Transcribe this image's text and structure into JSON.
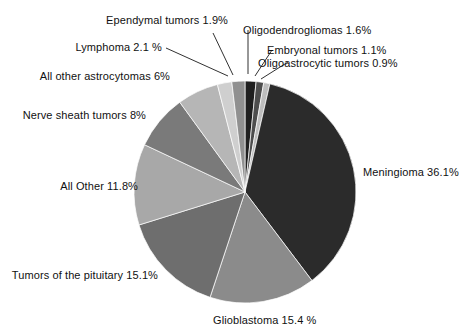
{
  "chart_data": {
    "type": "pie",
    "title": "",
    "subtitle": "",
    "xlabel": "",
    "ylabel": "",
    "legend_position": "none",
    "grid": false,
    "value_unit": "%",
    "start_angle_deg": -90,
    "direction": "clockwise",
    "categories": [
      "Oligodendrogliomas",
      "Embryonal tumors",
      "Oligoastrocytic tumors",
      "Meningioma",
      "Glioblastoma",
      "Tumors of the pituitary",
      "All Other",
      "Nerve sheath tumors",
      "All other astrocytomas",
      "Lymphoma",
      "Ependymal tumors"
    ],
    "values": [
      1.6,
      1.1,
      0.9,
      36.1,
      15.4,
      15.1,
      11.8,
      8.0,
      6.0,
      2.1,
      1.9
    ],
    "colors": [
      "#1f1f1f",
      "#4d4d4d",
      "#bdbdbd",
      "#2b2b2b",
      "#8b8b8b",
      "#6e6e6e",
      "#a8a8a8",
      "#7a7a7a",
      "#b6b6b6",
      "#cfcfcf",
      "#909090"
    ],
    "slice_labels": [
      "Oligodendrogliomas 1.6%",
      "Embryonal tumors 1.1%",
      "Oligoastrocytic tumors 0.9%",
      "Meningioma 36.1%",
      "Glioblastoma 15.4 %",
      "Tumors of the pituitary 15.1%",
      "All Other 11.8%",
      "Nerve sheath tumors 8%",
      "All other astrocytomas 6%",
      "Lymphoma 2.1 %",
      "Ependymal tumors 1.9%"
    ]
  },
  "labels": {
    "ependymal": "Ependymal tumors 1.9%",
    "oligodendrogliomas": "Oligodendrogliomas 1.6%",
    "lymphoma": "Lymphoma 2.1 %",
    "embryonal": "Embryonal tumors 1.1%",
    "oligoastrocytic": "Oligoastrocytic tumors 0.9%",
    "astrocytomas": "All other astrocytomas 6%",
    "nerve_sheath": "Nerve sheath tumors 8%",
    "all_other": "All Other 11.8%",
    "pituitary": "Tumors of the pituitary 15.1%",
    "glioblastoma": "Glioblastoma 15.4 %",
    "meningioma": "Meningioma 36.1%"
  },
  "style": {
    "background": "#ffffff",
    "text_color": "#111111",
    "leader_line_color": "#1a1a1a"
  }
}
